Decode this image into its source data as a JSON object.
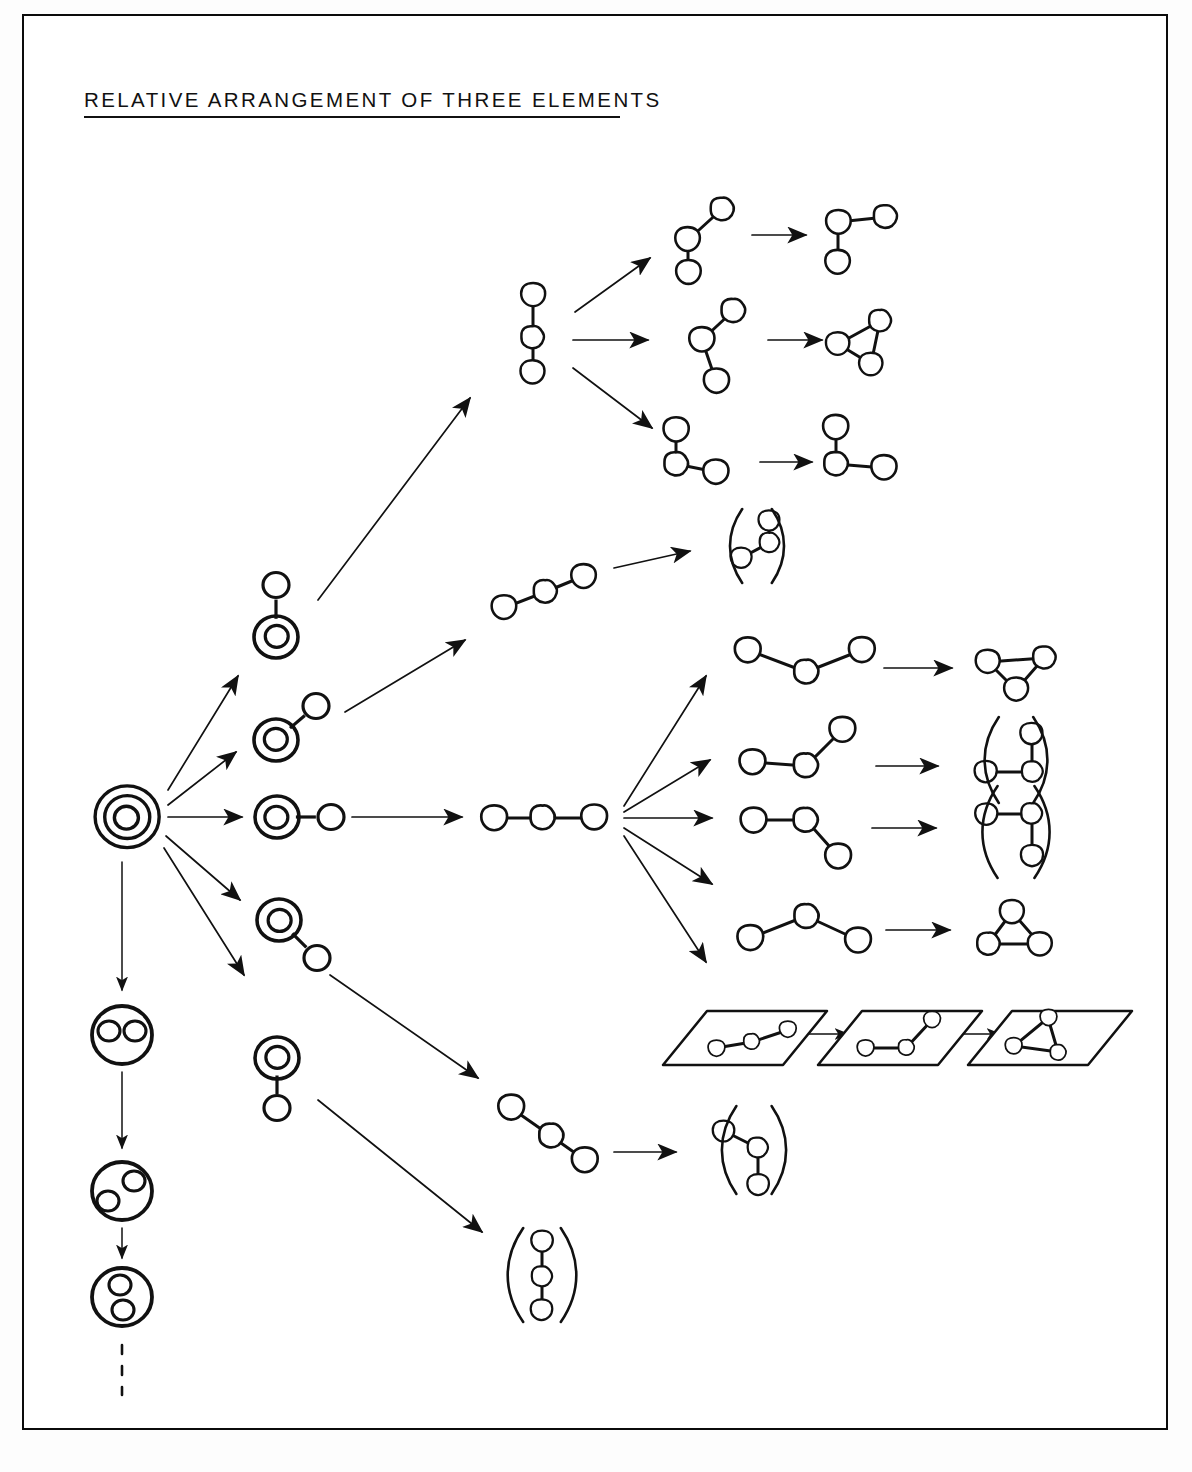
{
  "page": {
    "title": "RELATIVE ARRANGEMENT OF THREE ELEMENTS",
    "width": 1192,
    "height": 1472,
    "background": "#ffffff",
    "ink_color": "#111111",
    "frame": {
      "x": 22,
      "y": 14,
      "width": 1146,
      "height": 1416,
      "stroke": "#0b0b0b"
    }
  },
  "diagram": {
    "kind": "hand-drawn enumeration tree",
    "root": {
      "label": "triple-concentric-circle",
      "rings": 3
    },
    "level2_nodes": [
      {
        "id": "n-up",
        "label": "double-circle-with-satellite-up",
        "satellite_direction": "up"
      },
      {
        "id": "n-upright",
        "label": "double-circle-with-satellite-up-right",
        "satellite_direction": "up-right"
      },
      {
        "id": "n-right",
        "label": "double-circle-with-satellite-right",
        "satellite_direction": "right"
      },
      {
        "id": "n-downright",
        "label": "double-circle-with-satellite-down-right",
        "satellite_direction": "down-right"
      },
      {
        "id": "n-down",
        "label": "double-circle-with-satellite-down",
        "satellite_direction": "down"
      }
    ],
    "chain_hubs": [
      {
        "id": "hub-vertical",
        "label": "vertical-three-chain",
        "orientation": "vertical",
        "branches": 3
      },
      {
        "id": "hub-diag-up",
        "label": "ascending-diagonal-three-chain",
        "orientation": "diagonal-up",
        "branches": 1
      },
      {
        "id": "hub-horizontal",
        "label": "horizontal-three-chain",
        "orientation": "horizontal",
        "branches": 5
      },
      {
        "id": "hub-diag-down",
        "label": "descending-diagonal-three-chain",
        "orientation": "diagonal-down",
        "branches": 1
      }
    ],
    "results": [
      {
        "id": "r1",
        "label": "corner-l-shape",
        "parenthesized": false
      },
      {
        "id": "r2",
        "label": "triangle",
        "parenthesized": false
      },
      {
        "id": "r3",
        "label": "tee-shape",
        "parenthesized": false
      },
      {
        "id": "r4",
        "label": "bent-chain",
        "parenthesized": true
      },
      {
        "id": "r5",
        "label": "triangle",
        "parenthesized": false
      },
      {
        "id": "r6",
        "label": "tee-up-right",
        "parenthesized": true
      },
      {
        "id": "r7",
        "label": "tee-down-right",
        "parenthesized": true
      },
      {
        "id": "r8",
        "label": "triangle",
        "parenthesized": false
      },
      {
        "id": "r9",
        "label": "bent-chain",
        "parenthesized": true
      },
      {
        "id": "r10",
        "label": "vertical-three-chain",
        "parenthesized": true
      }
    ],
    "plane_panels": [
      {
        "id": "p1",
        "label": "plane-with-shallow-chain"
      },
      {
        "id": "p2",
        "label": "plane-with-bent-chain"
      },
      {
        "id": "p3",
        "label": "plane-with-triangle"
      }
    ],
    "left_column": {
      "label": "enclosed-elements-sequence",
      "items": [
        {
          "id": "c1",
          "label": "circle-with-two-adjacent-dots"
        },
        {
          "id": "c2",
          "label": "circle-with-two-separated-dots"
        },
        {
          "id": "c3",
          "label": "circle-with-two-stacked-dots"
        }
      ],
      "trailing": "dashed-continuation"
    }
  }
}
